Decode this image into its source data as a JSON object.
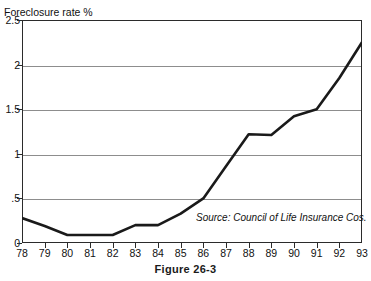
{
  "figure": {
    "caption": "Figure 26-3",
    "title_remnant": "",
    "source_note": "Source: Council of Life Insurance Cos.",
    "y_axis_title": "Foreclosure rate %"
  },
  "colors": {
    "line": "#1a1a1a",
    "grid": "#8d8d8d",
    "frame": "#2b2b2b",
    "background": "#ffffff",
    "text": "#111111"
  },
  "chart_data": {
    "type": "line",
    "title": "",
    "xlabel": "",
    "ylabel": "Foreclosure rate %",
    "x": [
      78,
      79,
      80,
      81,
      82,
      83,
      84,
      85,
      86,
      87,
      88,
      89,
      90,
      91,
      92,
      93
    ],
    "categories": [
      "78",
      "79",
      "80",
      "81",
      "82",
      "83",
      "84",
      "85",
      "86",
      "87",
      "88",
      "89",
      "90",
      "91",
      "92",
      "93"
    ],
    "values": [
      0.28,
      0.19,
      0.09,
      0.09,
      0.09,
      0.2,
      0.2,
      0.33,
      0.5,
      0.86,
      1.22,
      1.21,
      1.42,
      1.5,
      1.85,
      2.25
    ],
    "series": [
      {
        "name": "Foreclosure rate",
        "values": [
          0.28,
          0.19,
          0.09,
          0.09,
          0.09,
          0.2,
          0.2,
          0.33,
          0.5,
          0.86,
          1.22,
          1.21,
          1.42,
          1.5,
          1.85,
          2.25
        ]
      }
    ],
    "xlim": [
      78,
      93
    ],
    "ylim": [
      0,
      2.5
    ],
    "ytick_labels": [
      "0",
      ".5",
      "1",
      "1.5",
      "2",
      "2.5"
    ],
    "ytick_values": [
      0,
      0.5,
      1,
      1.5,
      2,
      2.5
    ],
    "xtick_labels": [
      "78",
      "79",
      "80",
      "81",
      "82",
      "83",
      "84",
      "85",
      "86",
      "87",
      "88",
      "89",
      "90",
      "91",
      "92",
      "93"
    ],
    "grid": "horizontal",
    "legend": "none",
    "annotations": [
      {
        "text": "Source: Council of Life Insurance Cos.",
        "style": "italic"
      }
    ]
  }
}
